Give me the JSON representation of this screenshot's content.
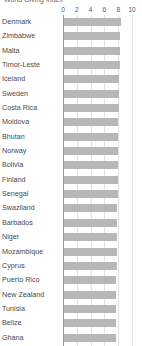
{
  "chart_data": {
    "type": "bar",
    "orientation": "horizontal",
    "title": "World Giving Index",
    "xlabel": "",
    "ylabel": "",
    "xlim": [
      0,
      10
    ],
    "grid": true,
    "legend": "none",
    "xticks": [
      0,
      2,
      4,
      6,
      8,
      10
    ],
    "xtick_labels": [
      "0",
      "2",
      "4",
      "6",
      "8",
      "10"
    ],
    "categories": [
      "Denmark",
      "Zimbabwe",
      "Malta",
      "Timor-Leste",
      "Iceland",
      "Sweden",
      "Costa Rica",
      "Moldova",
      "Bhutan",
      "Norway",
      "Bolivia",
      "Finland",
      "Senegal",
      "Swaziland",
      "Barbados",
      "Niger",
      "Mozambique",
      "Cyprus",
      "Puerto Rico",
      "New Zealand",
      "Tunisia",
      "Belize",
      "Ghana"
    ],
    "values": [
      8.45,
      8.3,
      8.3,
      8.2,
      8.15,
      8.1,
      8.05,
      8.0,
      8.0,
      7.95,
      7.95,
      7.9,
      7.9,
      7.85,
      7.85,
      7.8,
      7.8,
      7.8,
      7.75,
      7.75,
      7.7,
      7.7,
      7.65
    ],
    "bar_color": "#b7b7b7",
    "grid_color": "#e2e2e2",
    "axis_color": "#9a9a9a"
  }
}
